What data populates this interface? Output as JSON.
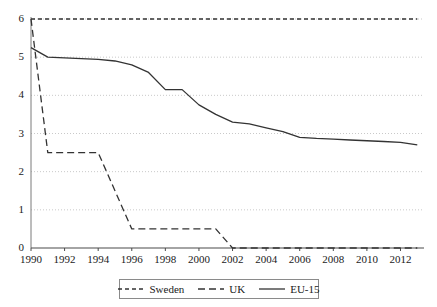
{
  "chart_data": {
    "type": "line",
    "title": "",
    "subtitle": "",
    "xlabel": "",
    "ylabel": "",
    "xlim": [
      1990,
      2013.4
    ],
    "ylim": [
      0,
      6
    ],
    "grid": "horizontal-dotted",
    "legend_position": "bottom-center",
    "x_ticks": [
      "1990",
      "1992",
      "1994",
      "1996",
      "1998",
      "2000",
      "2002",
      "2004",
      "2006",
      "2008",
      "2010",
      "2012"
    ],
    "y_ticks": [
      "0",
      "1",
      "2",
      "3",
      "4",
      "5",
      "6"
    ],
    "x": [
      1990,
      1991,
      1992,
      1993,
      1994,
      1995,
      1996,
      1997,
      1998,
      1999,
      2000,
      2001,
      2002,
      2003,
      2004,
      2005,
      2006,
      2007,
      2008,
      2009,
      2010,
      2011,
      2012,
      2013
    ],
    "series": [
      {
        "name": "Sweden",
        "style": "dashed-short",
        "color": "#333333",
        "values": [
          6,
          6,
          6,
          6,
          6,
          6,
          6,
          6,
          6,
          6,
          6,
          6,
          6,
          6,
          6,
          6,
          6,
          6,
          6,
          6,
          6,
          6,
          6,
          6
        ]
      },
      {
        "name": "UK",
        "style": "dashed-long",
        "color": "#333333",
        "values": [
          6,
          2.5,
          2.5,
          2.5,
          2.5,
          1.5,
          0.5,
          0.5,
          0.5,
          0.5,
          0.5,
          0.5,
          0,
          0,
          0,
          0,
          0,
          0,
          0,
          0,
          0,
          0,
          0,
          0
        ]
      },
      {
        "name": "EU-15",
        "style": "solid",
        "color": "#333333",
        "values": [
          5.25,
          5.0,
          4.98,
          4.96,
          4.94,
          4.9,
          4.8,
          4.6,
          4.15,
          4.15,
          3.75,
          3.5,
          3.3,
          3.25,
          3.15,
          3.05,
          2.9,
          2.87,
          2.85,
          2.83,
          2.81,
          2.79,
          2.77,
          2.7
        ]
      }
    ]
  },
  "legend": {
    "entries": [
      {
        "label": "Sweden",
        "style": "dashed-short"
      },
      {
        "label": "UK",
        "style": "dashed-long"
      },
      {
        "label": "EU-15",
        "style": "solid"
      }
    ]
  }
}
